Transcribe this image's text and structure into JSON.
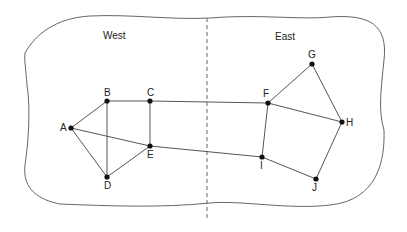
{
  "regions": {
    "west": "West",
    "east": "East"
  },
  "nodes": {
    "A": {
      "label": "A",
      "x": 71,
      "y": 128
    },
    "B": {
      "label": "B",
      "x": 107,
      "y": 101
    },
    "C": {
      "label": "C",
      "x": 150,
      "y": 101
    },
    "D": {
      "label": "D",
      "x": 107,
      "y": 177
    },
    "E": {
      "label": "E",
      "x": 150,
      "y": 146
    },
    "F": {
      "label": "F",
      "x": 268,
      "y": 103
    },
    "G": {
      "label": "G",
      "x": 312,
      "y": 64
    },
    "H": {
      "label": "H",
      "x": 342,
      "y": 122
    },
    "I": {
      "label": "I",
      "x": 262,
      "y": 157
    },
    "J": {
      "label": "J",
      "x": 316,
      "y": 179
    }
  },
  "edges": [
    [
      "A",
      "B"
    ],
    [
      "A",
      "D"
    ],
    [
      "A",
      "E"
    ],
    [
      "B",
      "C"
    ],
    [
      "B",
      "D"
    ],
    [
      "C",
      "E"
    ],
    [
      "D",
      "E"
    ],
    [
      "C",
      "F"
    ],
    [
      "E",
      "I"
    ],
    [
      "F",
      "G"
    ],
    [
      "F",
      "H"
    ],
    [
      "F",
      "I"
    ],
    [
      "G",
      "H"
    ],
    [
      "H",
      "J"
    ],
    [
      "I",
      "J"
    ]
  ]
}
